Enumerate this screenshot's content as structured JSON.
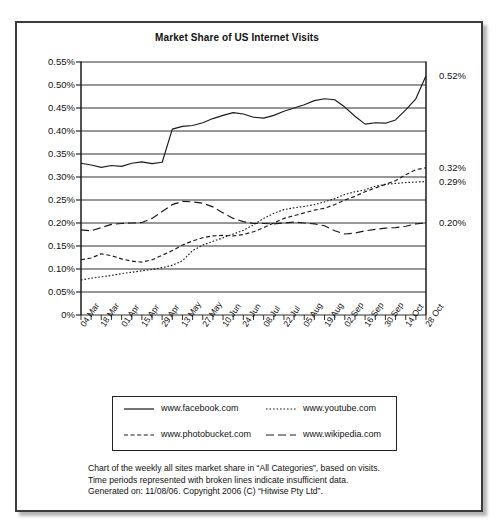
{
  "page": {
    "top_fragment": "· · ·   ·  ·   ·   ·    ·  ·   ·   ·   ·",
    "card_border_color": "#3b3b3b"
  },
  "chart_data": {
    "type": "line",
    "title": "Market Share of US Internet Visits",
    "xlabel": "",
    "ylabel": "",
    "ylim": [
      0,
      0.55
    ],
    "ytick_labels": [
      "0.55%",
      "0.50%",
      "0.45%",
      "0.40%",
      "0.35%",
      "0.30%",
      "0.25%",
      "0.20%",
      "0.15%",
      "0.10%",
      "0.05%",
      "0%"
    ],
    "ytick_values": [
      0.55,
      0.5,
      0.45,
      0.4,
      0.35,
      0.3,
      0.25,
      0.2,
      0.15,
      0.1,
      0.05,
      0
    ],
    "grid": true,
    "legend_position": "below-plot",
    "categories": [
      "04 Mar",
      "11 Mar",
      "18 Mar",
      "25 Mar",
      "01 Apr",
      "08 Apr",
      "15 Apr",
      "22 Apr",
      "29 Apr",
      "06 May",
      "13 May",
      "20 May",
      "27 May",
      "03 Jun",
      "10 Jun",
      "17 Jun",
      "24 Jun",
      "01 Jul",
      "08 Jul",
      "15 Jul",
      "22 Jul",
      "29 Jul",
      "05 Aug",
      "12 Aug",
      "19 Aug",
      "26 Aug",
      "02 Sep",
      "09 Sep",
      "16 Sep",
      "23 Sep",
      "30 Sep",
      "07 Oct",
      "14 Oct",
      "21 Oct",
      "28 Oct"
    ],
    "tick_labels_shown": [
      "04 Mar",
      "18 Mar",
      "01 Apr",
      "15 Apr",
      "29 Apr",
      "13 May",
      "27 May",
      "10 Jun",
      "24 Jun",
      "08 Jul",
      "22 Jul",
      "05 Aug",
      "19 Aug",
      "02 Sep",
      "16 Sep",
      "30 Sep",
      "14 Oct",
      "28 Oct"
    ],
    "series": [
      {
        "name": "www.facebook.com",
        "style": "solid",
        "end_label": "0.52%",
        "values": [
          0.33,
          0.326,
          0.321,
          0.325,
          0.323,
          0.33,
          0.333,
          0.329,
          0.332,
          0.404,
          0.41,
          0.412,
          0.418,
          0.427,
          0.434,
          0.44,
          0.437,
          0.43,
          0.428,
          0.434,
          0.443,
          0.45,
          0.457,
          0.466,
          0.47,
          0.468,
          0.452,
          0.432,
          0.415,
          0.418,
          0.417,
          0.424,
          0.446,
          0.47,
          0.52
        ]
      },
      {
        "name": "www.youtube.com",
        "style": "dotted",
        "end_label": "0.29%",
        "values": [
          0.076,
          0.08,
          0.083,
          0.086,
          0.09,
          0.093,
          0.096,
          0.099,
          0.103,
          0.108,
          0.118,
          0.14,
          0.152,
          0.16,
          0.168,
          0.176,
          0.184,
          0.196,
          0.21,
          0.221,
          0.229,
          0.233,
          0.236,
          0.24,
          0.246,
          0.253,
          0.262,
          0.268,
          0.272,
          0.28,
          0.284,
          0.286,
          0.288,
          0.289,
          0.29
        ]
      },
      {
        "name": "www.photobucket.com",
        "style": "dashed-short",
        "end_label": "0.32%",
        "values": [
          0.12,
          0.124,
          0.133,
          0.129,
          0.122,
          0.117,
          0.115,
          0.12,
          0.13,
          0.14,
          0.152,
          0.161,
          0.168,
          0.172,
          0.173,
          0.172,
          0.175,
          0.181,
          0.19,
          0.2,
          0.21,
          0.216,
          0.222,
          0.228,
          0.232,
          0.24,
          0.25,
          0.258,
          0.268,
          0.276,
          0.284,
          0.292,
          0.305,
          0.316,
          0.32
        ]
      },
      {
        "name": "www.wikipedia.com",
        "style": "dashed-long",
        "end_label": "0.20%",
        "values": [
          0.185,
          0.183,
          0.19,
          0.197,
          0.199,
          0.2,
          0.201,
          0.21,
          0.225,
          0.24,
          0.247,
          0.246,
          0.243,
          0.235,
          0.222,
          0.21,
          0.203,
          0.199,
          0.199,
          0.198,
          0.2,
          0.202,
          0.2,
          0.198,
          0.194,
          0.183,
          0.176,
          0.178,
          0.183,
          0.186,
          0.189,
          0.19,
          0.193,
          0.198,
          0.2
        ]
      }
    ]
  },
  "legend": {
    "items": [
      {
        "label": "www.facebook.com",
        "style": "solid"
      },
      {
        "label": "www.youtube.com",
        "style": "dotted"
      },
      {
        "label": "www.photobucket.com",
        "style": "dashed-short"
      },
      {
        "label": "www.wikipedia.com",
        "style": "dashed-long"
      }
    ]
  },
  "caption": {
    "line1": "Chart of the weekly all sites market share in “All Categories”, based on visits.",
    "line2": "Time periods represented with broken lines indicate insufficient data.",
    "line3": "Generated on: 11/08/06. Copyright 2006 (C) “Hitwise Pty Ltd”."
  }
}
